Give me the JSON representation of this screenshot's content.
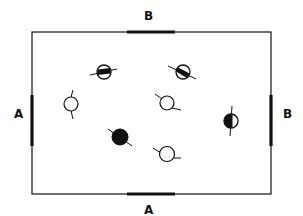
{
  "diagram": {
    "type": "field-layout",
    "colors": {
      "line": "#111111",
      "fill": "#111111",
      "background": "#ffffff"
    },
    "boundary": {
      "x1": 32,
      "y1": 32,
      "x2": 271,
      "y2": 194
    },
    "labels": {
      "top": "B",
      "bottom": "A",
      "left": "A",
      "right": "B"
    },
    "goals": [
      {
        "id": "top-B",
        "side": "top",
        "label": "B"
      },
      {
        "id": "bottom-A",
        "side": "bottom",
        "label": "A"
      },
      {
        "id": "left-A",
        "side": "left",
        "label": "A"
      },
      {
        "id": "right-B",
        "side": "right",
        "label": "B"
      }
    ],
    "symbols": [
      {
        "id": 1,
        "x": 104,
        "y": 72,
        "fill": "horizontal-bar"
      },
      {
        "id": 2,
        "x": 183,
        "y": 72,
        "fill": "diagonal-bar"
      },
      {
        "id": 3,
        "x": 71,
        "y": 104,
        "fill": "empty"
      },
      {
        "id": 4,
        "x": 167,
        "y": 103,
        "fill": "empty"
      },
      {
        "id": 5,
        "x": 231,
        "y": 121,
        "fill": "vertical-half"
      },
      {
        "id": 6,
        "x": 120,
        "y": 137,
        "fill": "solid"
      },
      {
        "id": 7,
        "x": 167,
        "y": 154,
        "fill": "empty"
      }
    ]
  }
}
